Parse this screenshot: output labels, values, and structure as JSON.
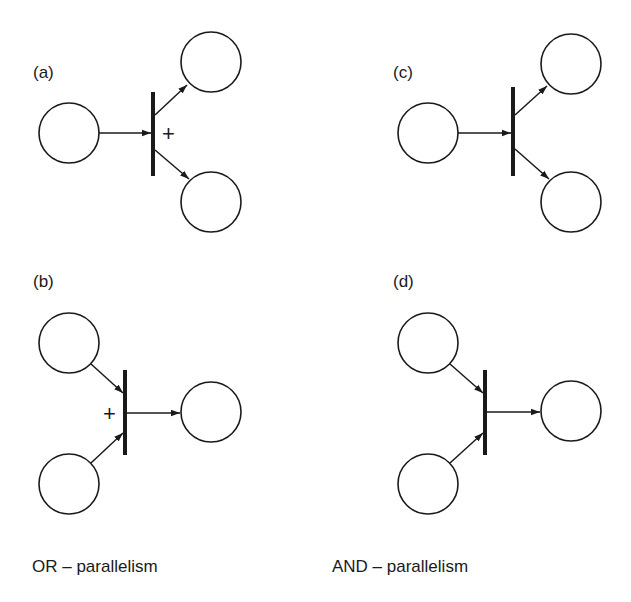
{
  "figure": {
    "panels": [
      {
        "id": "a",
        "label": "(a)",
        "kind": "fork",
        "marker": "+",
        "description": "OR-split: one input place, transition, two output places"
      },
      {
        "id": "b",
        "label": "(b)",
        "kind": "join",
        "marker": "+",
        "description": "OR-join: two input places, transition, one output place"
      },
      {
        "id": "c",
        "label": "(c)",
        "kind": "fork",
        "marker": "",
        "description": "AND-split: one input place, transition, two output places"
      },
      {
        "id": "d",
        "label": "(d)",
        "kind": "join",
        "marker": "",
        "description": "AND-join: two input places, transition, one output place"
      }
    ],
    "captions": {
      "left": "OR – parallelism",
      "right": "AND – parallelism"
    }
  }
}
